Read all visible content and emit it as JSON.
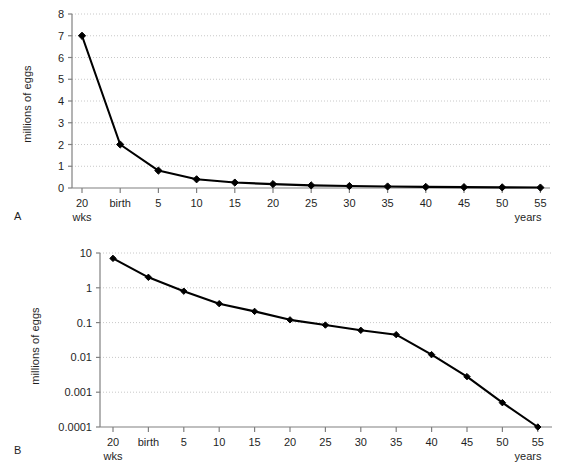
{
  "figure": {
    "panels": [
      {
        "letter": "A",
        "ylabel": "millions of eggs",
        "xunit": "years",
        "subunit": "wks"
      },
      {
        "letter": "B",
        "ylabel": "millions of eggs",
        "xunit": "years",
        "subunit": "wks"
      }
    ]
  },
  "chart_data": [
    {
      "type": "line",
      "title": "",
      "xlabel": "years",
      "ylabel": "millions of eggs",
      "scale": "linear",
      "ylim": [
        0,
        8
      ],
      "yticks": [
        "0",
        "1",
        "2",
        "3",
        "4",
        "5",
        "6",
        "7",
        "8"
      ],
      "ytick_values": [
        0,
        1,
        2,
        3,
        4,
        5,
        6,
        7,
        8
      ],
      "grid": true,
      "legend": "none",
      "categories": [
        "20",
        "birth",
        "5",
        "10",
        "15",
        "20",
        "25",
        "30",
        "35",
        "40",
        "45",
        "50",
        "55"
      ],
      "category_subnote": [
        "wks",
        "",
        "",
        "",
        "",
        "",
        "",
        "",
        "",
        "",
        "",
        "",
        ""
      ],
      "values": [
        7.0,
        2.0,
        0.8,
        0.4,
        0.25,
        0.18,
        0.12,
        0.09,
        0.07,
        0.05,
        0.04,
        0.03,
        0.02
      ],
      "marker": "diamond",
      "marker_color": "#000000",
      "line_color": "#000000"
    },
    {
      "type": "line",
      "title": "",
      "xlabel": "years",
      "ylabel": "millions of eggs",
      "scale": "log",
      "ylim": [
        0.0001,
        10
      ],
      "yticks": [
        "10",
        "1",
        "0.1",
        "0.01",
        "0.001",
        "0.0001"
      ],
      "ytick_values": [
        10,
        1,
        0.1,
        0.01,
        0.001,
        0.0001
      ],
      "grid": true,
      "legend": "none",
      "categories": [
        "20",
        "birth",
        "5",
        "10",
        "15",
        "20",
        "25",
        "30",
        "35",
        "40",
        "45",
        "50",
        "55"
      ],
      "category_subnote": [
        "wks",
        "",
        "",
        "",
        "",
        "",
        "",
        "",
        "",
        "",
        "",
        "",
        ""
      ],
      "values": [
        7.0,
        2.0,
        0.8,
        0.35,
        0.21,
        0.12,
        0.085,
        0.06,
        0.045,
        0.012,
        0.0028,
        0.0005,
        0.0001
      ],
      "marker": "diamond",
      "marker_color": "#000000",
      "line_color": "#000000"
    }
  ],
  "colors": {
    "line": "#000000",
    "marker": "#000000",
    "axis": "#808080",
    "grid": "#c8c8c8",
    "text": "#1f1f1f",
    "background": "#ffffff"
  }
}
